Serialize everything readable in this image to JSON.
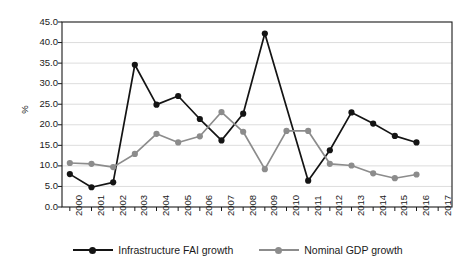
{
  "chart_data": {
    "type": "line",
    "title": "",
    "subtitle": "",
    "xlabel": "",
    "ylabel": "%",
    "ylim": [
      0.0,
      45.0
    ],
    "ytick_step": 5.0,
    "yticks": [
      "45.0",
      "40.0",
      "35.0",
      "30.0",
      "25.0",
      "20.0",
      "15.0",
      "10.0",
      "5.0",
      "0.0"
    ],
    "ytick_values": [
      45.0,
      40.0,
      35.0,
      30.0,
      25.0,
      20.0,
      15.0,
      10.0,
      5.0,
      0.0
    ],
    "categories": [
      "2000",
      "2001",
      "2002",
      "2003",
      "2004",
      "2005",
      "2006",
      "2007",
      "2008",
      "2009",
      "2010",
      "2011",
      "2012",
      "2013",
      "2014",
      "2015",
      "2016",
      "2017"
    ],
    "grid": "horizontal",
    "legend_position": "bottom",
    "series": [
      {
        "name": "Infrastructure FAI growth",
        "color": "#141414",
        "marker": "circle",
        "values": [
          8.0,
          4.8,
          6.0,
          34.6,
          24.9,
          27.0,
          21.4,
          16.2,
          22.7,
          42.2,
          null,
          6.4,
          13.8,
          23.0,
          20.3,
          17.3,
          15.7,
          null
        ]
      },
      {
        "name": "Nominal GDP growth",
        "color": "#8c8c8c",
        "marker": "circle",
        "values": [
          10.7,
          10.5,
          9.7,
          12.9,
          17.8,
          15.7,
          17.2,
          23.1,
          18.3,
          9.2,
          18.5,
          18.5,
          10.5,
          10.1,
          8.2,
          7.0,
          7.9,
          null
        ]
      }
    ]
  },
  "axis": {
    "label_y": "%"
  },
  "legend": {
    "items": [
      {
        "label": "Infrastructure FAI growth",
        "color": "#141414"
      },
      {
        "label": "Nominal GDP growth",
        "color": "#8c8c8c"
      }
    ]
  },
  "style": {
    "background": "#ffffff",
    "plot_border": "#1a1a1a",
    "gridline": "#d9d9d9",
    "series_black": "#141414",
    "series_gray": "#8c8c8c"
  }
}
